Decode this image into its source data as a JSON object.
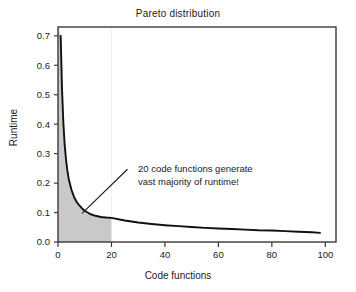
{
  "chart_data": {
    "type": "line",
    "title": "Pareto distribution",
    "xlabel": "Code functions",
    "ylabel": "Runtime",
    "xlim": [
      0,
      104
    ],
    "ylim": [
      0.0,
      0.73
    ],
    "grid": false,
    "legend": "none",
    "xticks": [
      0,
      20,
      40,
      60,
      80,
      100
    ],
    "xtick_labels": [
      "0",
      "20",
      "40",
      "60",
      "80",
      "100"
    ],
    "yticks": [
      0.0,
      0.1,
      0.2,
      0.3,
      0.4,
      0.5,
      0.6,
      0.7
    ],
    "ytick_labels": [
      "0.0",
      "0.1",
      "0.2",
      "0.3",
      "0.4",
      "0.5",
      "0.6",
      "0.7"
    ],
    "series": [
      {
        "name": "Pareto runtime curve",
        "x": [
          1,
          1.5,
          2,
          2.5,
          3,
          3.5,
          4,
          5,
          6,
          7,
          8,
          9,
          10,
          12,
          14,
          16,
          18,
          20,
          25,
          30,
          35,
          40,
          45,
          50,
          55,
          60,
          65,
          70,
          75,
          80,
          85,
          90,
          95,
          98
        ],
        "y": [
          0.7,
          0.52,
          0.405,
          0.33,
          0.28,
          0.243,
          0.215,
          0.178,
          0.153,
          0.136,
          0.124,
          0.114,
          0.106,
          0.095,
          0.089,
          0.085,
          0.083,
          0.082,
          0.073,
          0.066,
          0.061,
          0.057,
          0.054,
          0.051,
          0.048,
          0.046,
          0.044,
          0.042,
          0.04,
          0.039,
          0.037,
          0.035,
          0.033,
          0.031
        ]
      }
    ],
    "shaded_region": {
      "label": "top 20 code functions",
      "x_start": 0,
      "x_end": 20,
      "color": "#c9c9c9"
    },
    "annotations": [
      {
        "line1": "20 code functions generate",
        "line2": "vast majority of runtime!",
        "pointer_from_x": 9,
        "pointer_from_y": 0.097,
        "pointer_to_x": 26,
        "pointer_to_y": 0.247
      }
    ],
    "colors": {
      "curve": "#111111",
      "axis": "#3a3a3a",
      "shade": "#c9c9c9",
      "background": "#ffffff"
    }
  }
}
